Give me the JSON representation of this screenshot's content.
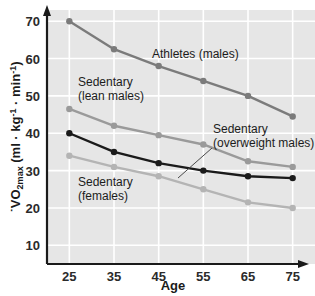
{
  "chart_data": {
    "type": "line",
    "title": "",
    "xlabel": "Age",
    "ylabel": "VO2max (ml · kg-1 · min-1)",
    "ylabel_parts": {
      "v_dot": "˙",
      "v": "V",
      "o": "O",
      "two": "2",
      "max": "max",
      "units_open": " (ml · kg",
      "neg_one_a": "-1",
      "units_mid": " · min",
      "neg_one_b": "-1",
      "units_close": ")"
    },
    "categories": [
      25,
      35,
      45,
      55,
      65,
      75
    ],
    "x": [
      25,
      35,
      45,
      55,
      65,
      75
    ],
    "xlim": [
      20,
      80
    ],
    "ylim": [
      5,
      73
    ],
    "yticks": [
      10,
      20,
      30,
      40,
      50,
      60,
      70
    ],
    "xticks": [
      25,
      35,
      45,
      55,
      65,
      75
    ],
    "grid": true,
    "legend": "inline-annotations",
    "series": [
      {
        "name": "Athletes (males)",
        "color": "#7b7b7b",
        "values": [
          70,
          62.5,
          58,
          54,
          50,
          44.5
        ]
      },
      {
        "name": "Sedentary (lean males)",
        "color": "#9a9a9a",
        "values": [
          46.5,
          42,
          39.5,
          37,
          32.5,
          31
        ]
      },
      {
        "name": "Sedentary (overweight males)",
        "color": "#1a1a1a",
        "values": [
          40,
          35,
          32,
          30,
          28.5,
          28
        ]
      },
      {
        "name": "Sedentary (females)",
        "color": "#b4b4b4",
        "values": [
          34,
          31,
          28.5,
          25,
          21.5,
          20
        ]
      }
    ],
    "annotations": [
      {
        "id": "athletes",
        "text_lines": [
          "Athletes (males)"
        ],
        "x": 152,
        "y": 58
      },
      {
        "id": "lean-males",
        "text_lines": [
          "Sedentary",
          "(lean males)"
        ],
        "x": 78,
        "y": 86
      },
      {
        "id": "overweight-males",
        "text_lines": [
          "Sedentary",
          "(overweight males)"
        ],
        "x": 213,
        "y": 133
      },
      {
        "id": "females",
        "text_lines": [
          "Sedentary",
          "(females)"
        ],
        "x": 78,
        "y": 186
      }
    ],
    "style": {
      "plot_background": "#e6e6e6",
      "gridline_color": "#ffffff",
      "axis_color": "#1a1a1a",
      "page_background": "#ffffff",
      "marker_radius": 3.2,
      "line_width": 2.4
    }
  },
  "axis_labels": {
    "x_title": "Age",
    "y_title": "VO2max (ml · kg-1 · min-1)"
  },
  "tick_text": {
    "y": [
      "70",
      "60",
      "50",
      "40",
      "30",
      "20",
      "10"
    ],
    "x": [
      "25",
      "35",
      "45",
      "55",
      "65",
      "75"
    ]
  }
}
